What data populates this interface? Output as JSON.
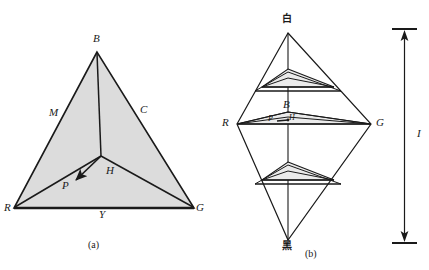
{
  "figure": {
    "panel_a": {
      "caption": "(a)",
      "vertices": {
        "top": "B",
        "bottom_left": "R",
        "bottom_right": "G"
      },
      "edges": {
        "left": "M",
        "right": "C",
        "bottom": "Y"
      },
      "interior": {
        "center_point": "H",
        "vector_point": "P"
      },
      "fill_color": "#dcdcdc",
      "stroke_color": "#1a1a1a"
    },
    "panel_b": {
      "caption": "(b)",
      "apex_top": "白",
      "apex_bottom": "黑",
      "left_vertex": "R",
      "right_vertex": "G",
      "mid_top_vertex": "B",
      "interior": {
        "center_point": "H",
        "vector_point": "P"
      },
      "axis_label": "I",
      "fill_color": "#e8e8e8",
      "stroke_color": "#1a1a1a"
    }
  },
  "colors": {
    "background": "#ffffff",
    "ink": "#1a1a1a",
    "triangle_fill": "#dcdcdc",
    "slice_fill": "#ebebeb"
  }
}
